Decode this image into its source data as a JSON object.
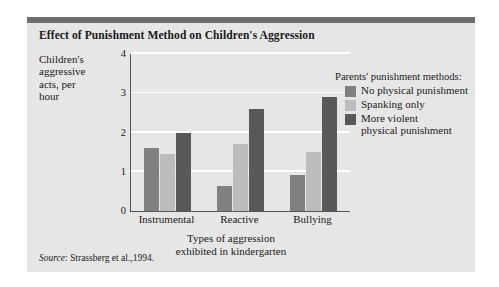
{
  "figure": {
    "title": "Effect of Punishment Method on Children's Aggression",
    "source_word": "Source",
    "source_text": ": Strassberg et al.,1994."
  },
  "legend": {
    "title": "Parents' punishment methods:",
    "items": [
      {
        "label": "No physical punishment",
        "color": "#808080"
      },
      {
        "label": "Spanking only",
        "color": "#bcbcbc"
      },
      {
        "label": "More violent\nphysical punishment",
        "color": "#595959"
      }
    ]
  },
  "chart_data": {
    "type": "bar",
    "title": "Effect of Punishment Method on Children's Aggression",
    "xlabel": "Types of aggression exhibited in kindergarten",
    "ylabel": "Children's aggressive acts, per hour",
    "categories": [
      "Instrumental",
      "Reactive",
      "Bullying"
    ],
    "series": [
      {
        "name": "No physical punishment",
        "color": "#808080",
        "values": [
          1.6,
          0.65,
          0.92
        ]
      },
      {
        "name": "Spanking only",
        "color": "#bcbcbc",
        "values": [
          1.45,
          1.7,
          1.5
        ]
      },
      {
        "name": "More violent physical punishment",
        "color": "#595959",
        "values": [
          2.0,
          2.6,
          2.9
        ]
      }
    ],
    "ylim": [
      0,
      4
    ],
    "yticks": [
      "0",
      "1",
      "2",
      "3",
      "4"
    ],
    "grid": true,
    "gridlines_at": [
      1,
      2,
      3,
      4
    ],
    "legend_position": "right",
    "plot_background": "#e0e0e0",
    "gridline_color": "#ffffff"
  },
  "axis": {
    "ylabel_lines": [
      "Children's",
      "aggressive",
      "acts, per",
      "hour"
    ],
    "xlabel_lines": [
      "Types of aggression",
      "exhibited in kindergarten"
    ]
  }
}
